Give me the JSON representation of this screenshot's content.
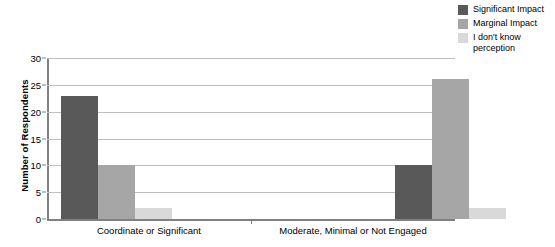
{
  "chart_data": {
    "type": "bar",
    "title": "",
    "xlabel": "",
    "ylabel": "Number of Respondents",
    "categories": [
      "Coordinate or Significant",
      "Moderate, Minimal or Not Engaged"
    ],
    "series": [
      {
        "name": "Significant Impact",
        "color": "#595959",
        "values": [
          23,
          10
        ]
      },
      {
        "name": "Marginal Impact",
        "color": "#a6a6a6",
        "values": [
          10,
          26
        ]
      },
      {
        "name": "I don't know\nperception",
        "color": "#d9d9d9",
        "values": [
          2,
          2
        ]
      }
    ],
    "ylim": [
      0,
      30
    ],
    "yticks": [
      0,
      5,
      10,
      15,
      20,
      25,
      30
    ],
    "ytick_labels": [
      "0",
      "5",
      "10",
      "15",
      "20",
      "25",
      "30"
    ],
    "grid": true,
    "legend_position": "top-right",
    "axis_color": "#808080",
    "gridline_color": "#bfbfbf",
    "background": "#ffffff"
  }
}
